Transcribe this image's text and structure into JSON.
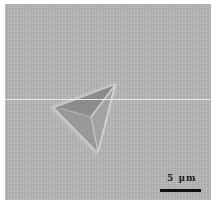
{
  "image": {
    "subject": "triangular indentation impression on a flat surface (micrograph)",
    "background_color": "#b9b9b9",
    "indent_color_dark": "#8f8f8f",
    "indent_edge_highlight": "#d4d4d4"
  },
  "scale_bar": {
    "label": "5 μm",
    "color": "#111111"
  }
}
